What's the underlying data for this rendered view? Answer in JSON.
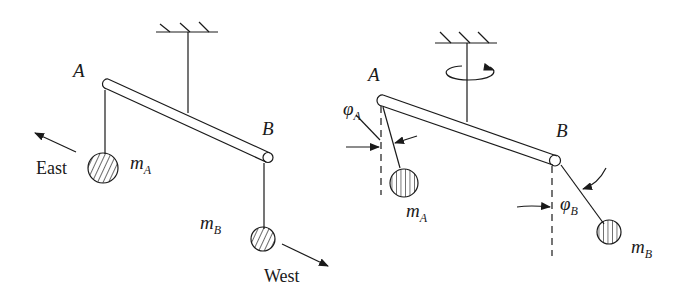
{
  "figure": {
    "left_panel": {
      "label_a": "A",
      "label_b": "B",
      "mass_a": {
        "symbol": "m",
        "subscript": "A"
      },
      "mass_b": {
        "symbol": "m",
        "subscript": "B"
      },
      "direction_a": "East",
      "direction_b": "West"
    },
    "right_panel": {
      "label_a": "A",
      "label_b": "B",
      "mass_a": {
        "symbol": "m",
        "subscript": "A"
      },
      "mass_b": {
        "symbol": "m",
        "subscript": "B"
      },
      "angle_a": {
        "symbol": "φ",
        "subscript": "A"
      },
      "angle_b": {
        "symbol": "φ",
        "subscript": "B"
      }
    },
    "colors": {
      "ink": "#1a1a1a",
      "background": "#ffffff"
    }
  }
}
